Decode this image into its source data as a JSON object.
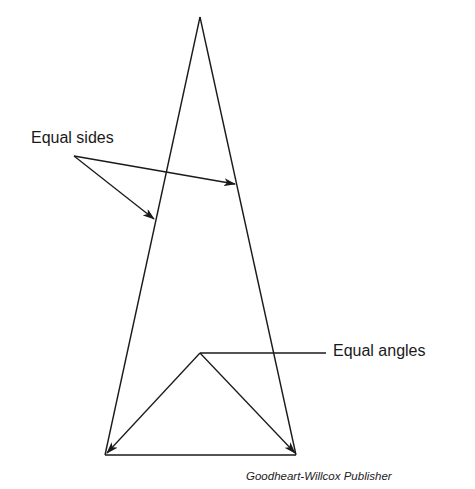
{
  "figure": {
    "type": "isosceles-triangle-diagram",
    "labels": {
      "sides": "Equal sides",
      "angles": "Equal angles"
    },
    "caption": "Goodheart-Willcox Publisher",
    "colors": {
      "line": "#1a1a1a",
      "background": "#ffffff"
    }
  }
}
